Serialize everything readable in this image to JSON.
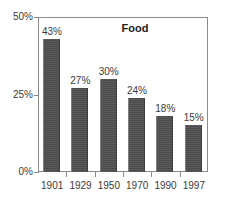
{
  "chart_data": {
    "type": "bar",
    "title": "Food",
    "xlabel": "",
    "ylabel": "",
    "categories": [
      "1901",
      "1929",
      "1950",
      "1970",
      "1990",
      "1997"
    ],
    "values": [
      43,
      27,
      30,
      24,
      18,
      15
    ],
    "value_labels": [
      "43%",
      "27%",
      "30%",
      "24%",
      "18%",
      "15%"
    ],
    "ylim": [
      0,
      50
    ],
    "y_ticks": [
      0,
      25,
      50
    ],
    "y_tick_labels": [
      "0%",
      "25%",
      "50%"
    ],
    "grid": false,
    "legend": false,
    "series": [
      {
        "name": "Food",
        "values": [
          43,
          27,
          30,
          24,
          18,
          15
        ]
      }
    ],
    "colors": {
      "bar_fill": "#4f4f4f",
      "bar_edge": "#3a3a3a",
      "axis": "#8a8a8a",
      "text": "#3b3b3b",
      "title": "#1d1d1d",
      "background": "#ffffff"
    }
  }
}
